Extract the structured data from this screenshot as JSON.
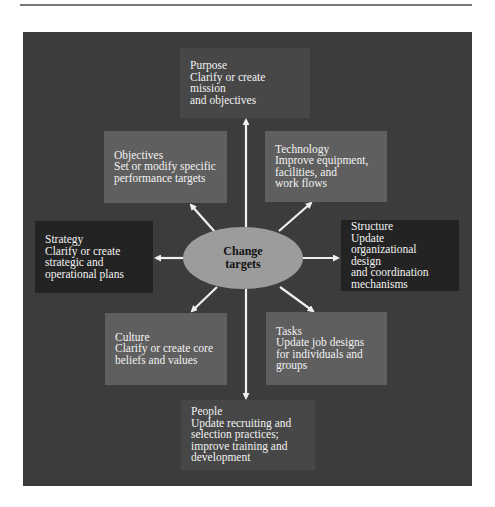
{
  "diagram": {
    "center": {
      "line1": "Change",
      "line2": "targets"
    },
    "targets": [
      {
        "id": "purpose",
        "title": "Purpose",
        "lines": [
          "Clarify or create mission",
          "and objectives"
        ]
      },
      {
        "id": "objectives",
        "title": "Objectives",
        "lines": [
          "Set or modify specific",
          "performance targets"
        ]
      },
      {
        "id": "technology",
        "title": "Technology",
        "lines": [
          "Improve equipment,",
          "facilities, and",
          "work flows"
        ]
      },
      {
        "id": "strategy",
        "title": "Strategy",
        "lines": [
          "Clarify or create",
          "strategic and",
          "operational plans"
        ]
      },
      {
        "id": "structure",
        "title": "Structure",
        "lines": [
          "Update",
          "organizational design",
          "and coordination",
          "mechanisms"
        ]
      },
      {
        "id": "culture",
        "title": "Culture",
        "lines": [
          "Clarify or create core",
          "beliefs and values"
        ]
      },
      {
        "id": "tasks",
        "title": "Tasks",
        "lines": [
          "Update job designs",
          "for individuals and",
          "groups"
        ]
      },
      {
        "id": "people",
        "title": "People",
        "lines": [
          "Update recruiting and",
          "selection practices;",
          "improve training and",
          "development"
        ]
      }
    ]
  },
  "colors": {
    "panel": "#3c3c3c",
    "box_light": "#5f5f5f",
    "box_mid": "#474747",
    "box_dark": "#232323",
    "ellipse": "#9c9c9c",
    "arrow": "#f0f0f0"
  }
}
